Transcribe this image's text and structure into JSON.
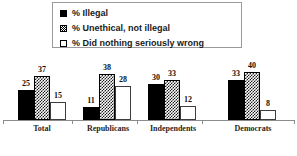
{
  "legend": {
    "items": [
      {
        "label": "% Illegal",
        "swatch": "solid-black-square-icon",
        "style": "solid"
      },
      {
        "label": "% Unethical, not illegal",
        "swatch": "hatched-square-icon",
        "style": "hatch"
      },
      {
        "label": "% Did nothing seriously wrong",
        "swatch": "open-square-icon",
        "style": "open"
      }
    ]
  },
  "footnote": {
    "text": ""
  },
  "chart_data": {
    "type": "bar",
    "title": "",
    "subtitle": "",
    "xlabel": "",
    "ylabel": "",
    "ylim": [
      0,
      45
    ],
    "grid": false,
    "legend_position": "top-center",
    "categories": [
      "Total",
      "Republicans",
      "Independents",
      "Democrats"
    ],
    "series": [
      {
        "name": "% Illegal",
        "values": [
          25,
          11,
          30,
          33
        ],
        "fill": "solid-black",
        "color": "#000000"
      },
      {
        "name": "% Unethical, not illegal",
        "values": [
          37,
          38,
          33,
          40
        ],
        "fill": "crosshatch",
        "color": "#1a1a1a"
      },
      {
        "name": "% Did nothing seriously wrong",
        "values": [
          15,
          28,
          12,
          8
        ],
        "fill": "open-white",
        "color": "#ffffff"
      }
    ]
  }
}
